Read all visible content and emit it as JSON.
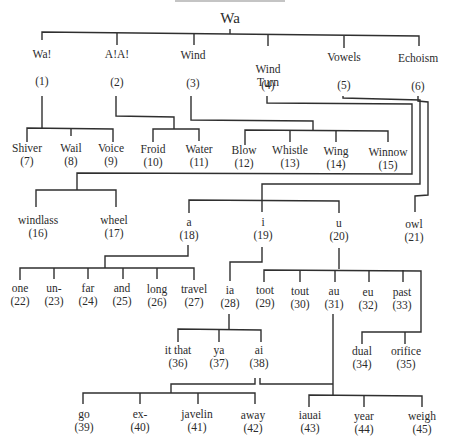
{
  "diagram": {
    "type": "tree",
    "title_visible": false,
    "root": {
      "label": "Wa",
      "x": 230,
      "y": 14
    },
    "nodes": [
      {
        "id": 1,
        "label": "Wa!",
        "num": "(1)",
        "x": 42,
        "y": 40,
        "num_y": 76
      },
      {
        "id": 2,
        "label": "A!A!",
        "num": "(2)",
        "x": 117,
        "y": 40,
        "num_y": 76
      },
      {
        "id": 3,
        "label": "Wind",
        "num": "(3)",
        "x": 193,
        "y": 40,
        "num_y": 78
      },
      {
        "id": 4,
        "label": "Wind\nTurn",
        "num": "(4)",
        "x": 268,
        "y": 40,
        "num_y": 78
      },
      {
        "id": 5,
        "label": "Vowels",
        "num": "(5)",
        "x": 343,
        "y": 40,
        "num_y": 79
      },
      {
        "id": 6,
        "label": "Echoism",
        "num": "(6)",
        "x": 418,
        "y": 40,
        "num_y": 79
      },
      {
        "id": 7,
        "label": "Shiver",
        "num": "(7)",
        "x": 27,
        "y": 145
      },
      {
        "id": 8,
        "label": "Wail",
        "num": "(8)",
        "x": 71,
        "y": 145
      },
      {
        "id": 9,
        "label": "Voice",
        "num": "(9)",
        "x": 111,
        "y": 145
      },
      {
        "id": 10,
        "label": "Froid",
        "num": "(10)",
        "x": 153,
        "y": 146
      },
      {
        "id": 11,
        "label": "Water",
        "num": "(11)",
        "x": 199,
        "y": 146
      },
      {
        "id": 12,
        "label": "Blow",
        "num": "(12)",
        "x": 244,
        "y": 147
      },
      {
        "id": 13,
        "label": "Whistle",
        "num": "(13)",
        "x": 290,
        "y": 147
      },
      {
        "id": 14,
        "label": "Wing",
        "num": "(14)",
        "x": 336,
        "y": 148
      },
      {
        "id": 15,
        "label": "Winnow",
        "num": "(15)",
        "x": 388,
        "y": 149
      },
      {
        "id": 16,
        "label": "windlass",
        "num": "(16)",
        "x": 38,
        "y": 217
      },
      {
        "id": 17,
        "label": "wheel",
        "num": "(17)",
        "x": 114,
        "y": 217
      },
      {
        "id": 18,
        "label": "a",
        "num": "(18)",
        "x": 189,
        "y": 219
      },
      {
        "id": 19,
        "label": "i",
        "num": "(19)",
        "x": 263,
        "y": 219
      },
      {
        "id": 20,
        "label": "u",
        "num": "(20)",
        "x": 339,
        "y": 220
      },
      {
        "id": 21,
        "label": "owl",
        "num": "(21)",
        "x": 414,
        "y": 221
      },
      {
        "id": 22,
        "label": "one",
        "num": "(22)",
        "x": 20,
        "y": 285
      },
      {
        "id": 23,
        "label": "un-",
        "num": "(23)",
        "x": 54,
        "y": 285
      },
      {
        "id": 24,
        "label": "far",
        "num": "(24)",
        "x": 88,
        "y": 285
      },
      {
        "id": 25,
        "label": "and",
        "num": "(25)",
        "x": 122,
        "y": 285
      },
      {
        "id": 26,
        "label": "long",
        "num": "(26)",
        "x": 157,
        "y": 286
      },
      {
        "id": 27,
        "label": "travel",
        "num": "(27)",
        "x": 194,
        "y": 286
      },
      {
        "id": 28,
        "label": "ia",
        "num": "(28)",
        "x": 230,
        "y": 287
      },
      {
        "id": 29,
        "label": "toot",
        "num": "(29)",
        "x": 265,
        "y": 287
      },
      {
        "id": 30,
        "label": "tout",
        "num": "(30)",
        "x": 300,
        "y": 288
      },
      {
        "id": 31,
        "label": "au",
        "num": "(31)",
        "x": 334,
        "y": 288
      },
      {
        "id": 32,
        "label": "eu",
        "num": "(32)",
        "x": 368,
        "y": 289
      },
      {
        "id": 33,
        "label": "past",
        "num": "(33)",
        "x": 402,
        "y": 289
      },
      {
        "id": 34,
        "label": "dual",
        "num": "(34)",
        "x": 362,
        "y": 348
      },
      {
        "id": 35,
        "label": "orifice",
        "num": "(35)",
        "x": 406,
        "y": 348
      },
      {
        "id": 36,
        "label": "it that",
        "num": "(36)",
        "x": 178,
        "y": 347
      },
      {
        "id": 37,
        "label": "ya",
        "num": "(37)",
        "x": 219,
        "y": 347
      },
      {
        "id": 38,
        "label": "ai",
        "num": "(38)",
        "x": 259,
        "y": 347
      },
      {
        "id": 39,
        "label": "go",
        "num": "(39)",
        "x": 84,
        "y": 411
      },
      {
        "id": 40,
        "label": "ex-",
        "num": "(40)",
        "x": 140,
        "y": 411
      },
      {
        "id": 41,
        "label": "javelin",
        "num": "(41)",
        "x": 197,
        "y": 411
      },
      {
        "id": 42,
        "label": "away",
        "num": "(42)",
        "x": 253,
        "y": 412
      },
      {
        "id": 43,
        "label": "iauai",
        "num": "(43)",
        "x": 310,
        "y": 412
      },
      {
        "id": 44,
        "label": "year",
        "num": "(44)",
        "x": 364,
        "y": 413
      },
      {
        "id": 45,
        "label": "weigh",
        "num": "(45)",
        "x": 422,
        "y": 413
      }
    ],
    "edges": [
      "Wa-1",
      "Wa-2",
      "Wa-3",
      "Wa-4",
      "Wa-5",
      "Wa-6",
      "1-7",
      "1-8",
      "1-9",
      "2-10",
      "2-11",
      "3-12",
      "3-13",
      "3-14",
      "3-15",
      "4-16",
      "4-17",
      "5-18",
      "5-19",
      "5-20",
      "6-21",
      "18-22",
      "18-23",
      "18-24",
      "18-25",
      "18-26",
      "18-27",
      "19-28",
      "20-29",
      "20-30",
      "20-31",
      "20-32",
      "20-33",
      "20-34",
      "20-35",
      "28-36",
      "28-37",
      "28-38",
      "38-39",
      "38-40",
      "38-41",
      "38-42",
      "31-43",
      "31-44",
      "31-45"
    ],
    "line_color": "#2f2f2f"
  }
}
